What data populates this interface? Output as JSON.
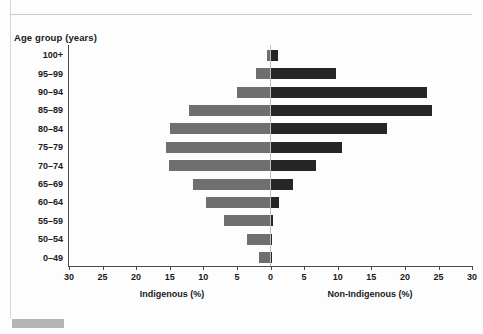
{
  "chart_data": {
    "type": "bar",
    "subtype": "population-pyramid",
    "title": "",
    "ylabel": "Age group (years)",
    "xlabel_left": "Indigenous (%)",
    "xlabel_right": "Non-Indigenous (%)",
    "categories": [
      "100+",
      "95–99",
      "90–94",
      "85–89",
      "80–84",
      "75–79",
      "70–74",
      "65–69",
      "60–64",
      "55–59",
      "50–54",
      "0–49"
    ],
    "series": [
      {
        "name": "Indigenous (%)",
        "side": "left",
        "color": "#6f6f6f",
        "values": [
          0.5,
          2.2,
          5.0,
          12.1,
          15.0,
          15.5,
          15.1,
          11.6,
          9.6,
          6.9,
          3.5,
          1.7
        ]
      },
      {
        "name": "Non-Indigenous (%)",
        "side": "right",
        "color": "#262626",
        "values": [
          1.1,
          9.8,
          23.3,
          24.0,
          17.4,
          10.6,
          6.8,
          3.4,
          1.2,
          0.4,
          0.2,
          0.05
        ]
      }
    ],
    "xticks_left": [
      30,
      25,
      20,
      15,
      10,
      5,
      0
    ],
    "xticks_right": [
      5,
      10,
      15,
      20,
      25,
      30
    ],
    "xlim": [
      30,
      30
    ],
    "xtick_step": 5,
    "grid": false,
    "legend": "none"
  },
  "axis": {
    "y_title": "Age group (years)",
    "tick_labels": [
      "30",
      "25",
      "20",
      "15",
      "10",
      "5",
      "0",
      "5",
      "10",
      "15",
      "20",
      "25",
      "30"
    ],
    "left_series_label": "Indigenous (%)",
    "right_series_label": "Non-Indigenous (%)"
  },
  "caption": {
    "swatch_label": "",
    "text": ""
  },
  "colors": {
    "indigenous_bar": "#6f6f6f",
    "non_indigenous_bar": "#262626",
    "axis": "#4a4a4a",
    "zero_line": "#bdbdbd"
  }
}
